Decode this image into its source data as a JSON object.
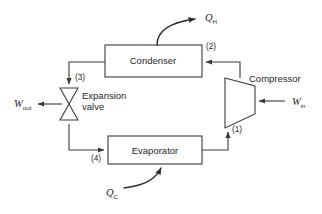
{
  "diagram": {
    "type": "process-flow-diagram",
    "background_color": "#ffffff",
    "line_color": "#3a3a3a",
    "text_color": "#1f1f1f",
    "components": {
      "condenser": {
        "label": "Condenser",
        "shape": "rectangle",
        "x": 105,
        "y": 45,
        "width": 97,
        "height": 32,
        "label_x": 153,
        "label_y": 64
      },
      "evaporator": {
        "label": "Evaporator",
        "shape": "rectangle",
        "x": 108,
        "y": 136,
        "width": 94,
        "height": 28,
        "label_x": 155,
        "label_y": 154
      },
      "compressor": {
        "label": "Compressor",
        "shape": "trapezoid",
        "points": "225,78 255,86 255,114 225,128",
        "label_x": 249,
        "label_y": 82
      },
      "expansion_valve": {
        "label_line1": "Expansion",
        "label_line2": "valve",
        "shape": "bowtie",
        "points_upper": "60,88 78,88 69,104",
        "points_lower": "60,120 78,120 69,104",
        "label_x": 82,
        "label_y1": 99,
        "label_y2": 110
      }
    },
    "energy_flows": {
      "q_hot": {
        "symbol": "Q",
        "subscript": "H",
        "direction": "out",
        "attached_to": "condenser",
        "label_x": 205,
        "label_y": 21
      },
      "q_cold": {
        "symbol": "Q",
        "subscript": "C",
        "direction": "in",
        "attached_to": "evaporator",
        "label_x": 106,
        "label_y": 196
      },
      "w_in": {
        "symbol": "W",
        "subscript": "in",
        "direction": "in",
        "attached_to": "compressor",
        "label_x": 292,
        "label_y": 105
      },
      "w_out": {
        "symbol": "W",
        "subscript": "out",
        "direction": "out",
        "attached_to": "expansion_valve",
        "label_x": 14,
        "label_y": 107
      }
    },
    "state_points": [
      {
        "label": "(1)",
        "x": 232,
        "y": 132,
        "between": "evaporator-to-compressor"
      },
      {
        "label": "(2)",
        "x": 206,
        "y": 49,
        "between": "compressor-to-condenser"
      },
      {
        "label": "(3)",
        "x": 75,
        "y": 80,
        "between": "condenser-to-expansion-valve"
      },
      {
        "label": "(4)",
        "x": 91,
        "y": 161,
        "between": "expansion-valve-to-evaporator"
      }
    ],
    "flow_paths": {
      "compressor_to_condenser": "M 240,78 L 240,62 L 206,62",
      "condenser_to_valve": "M 105,62 L 69,62 L 69,84",
      "valve_to_evaporator": "M 69,124 L 69,150 L 104,150",
      "evaporator_to_compressor": "M 202,150 L 228,150 L 228,132"
    },
    "heat_curves": {
      "q_hot_curve": "M 157,45 C 157,30 172,22 195,19",
      "q_cold_curve": "M 124,188 C 145,185 155,180 161,168"
    }
  }
}
